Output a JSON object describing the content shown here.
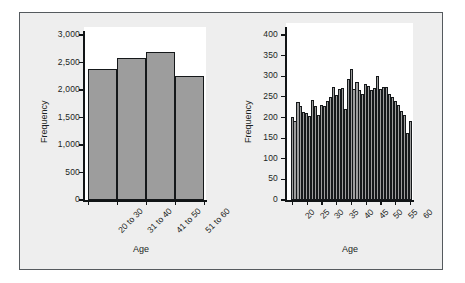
{
  "figure": {
    "background_color": "#eeeeee",
    "border_color": "#555a5e",
    "bar_fill_color": "#9d9d9d",
    "bar_edge_color": "#15181a"
  },
  "chart_data": [
    {
      "type": "bar",
      "title": "",
      "xlabel": "Age",
      "ylabel": "Frequency",
      "categories": [
        "20 to 30",
        "31 to 40",
        "41 to 50",
        "51 to 60"
      ],
      "values": [
        2380,
        2580,
        2690,
        2250
      ],
      "ylim": [
        0,
        3000
      ],
      "yticks": [
        0,
        500,
        1000,
        1500,
        2000,
        2500,
        3000
      ],
      "ytick_labels": [
        "0",
        "500",
        "1,000",
        "1,500",
        "2,000",
        "2,500",
        "3,000"
      ],
      "grid": false,
      "legend": "none"
    },
    {
      "type": "bar",
      "title": "",
      "xlabel": "Age",
      "ylabel": "Frequency",
      "categories": [
        20,
        21,
        22,
        23,
        24,
        25,
        26,
        27,
        28,
        29,
        30,
        31,
        32,
        33,
        34,
        35,
        36,
        37,
        38,
        39,
        40,
        41,
        42,
        43,
        44,
        45,
        46,
        47,
        48,
        49,
        50,
        51,
        52,
        53,
        54,
        55,
        56,
        57,
        58,
        59,
        60
      ],
      "values": [
        200,
        192,
        236,
        228,
        212,
        210,
        204,
        242,
        228,
        206,
        230,
        228,
        238,
        250,
        274,
        254,
        268,
        270,
        220,
        293,
        317,
        267,
        286,
        265,
        257,
        281,
        276,
        265,
        271,
        300,
        267,
        274,
        272,
        255,
        250,
        240,
        229,
        216,
        206,
        161,
        192
      ],
      "ylim": [
        0,
        400
      ],
      "yticks": [
        0,
        50,
        100,
        150,
        200,
        250,
        300,
        350,
        400
      ],
      "ytick_labels": [
        "0",
        "50",
        "100",
        "150",
        "200",
        "250",
        "300",
        "350",
        "400"
      ],
      "xticks": [
        20,
        25,
        30,
        35,
        40,
        45,
        50,
        55,
        60
      ],
      "xtick_labels": [
        "20",
        "25",
        "30",
        "35",
        "40",
        "45",
        "50",
        "55",
        "60"
      ],
      "grid": false,
      "legend": "none"
    }
  ]
}
